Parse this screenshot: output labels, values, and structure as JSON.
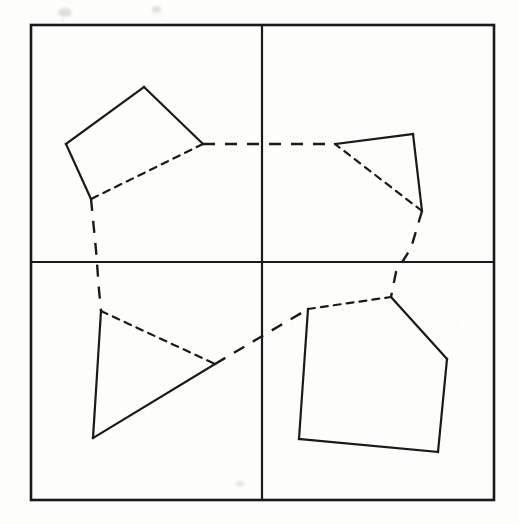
{
  "figure": {
    "canvas": {
      "width": 519,
      "height": 524
    },
    "colors": {
      "background": "#fdfdfc",
      "ink": "#1a1a1a",
      "ink_soft": "#2b2b2b"
    },
    "stroke": {
      "frame_width": 2.6,
      "divider_width": 2.2,
      "polygon_solid_width": 2.2,
      "polygon_dashed_width": 2.2,
      "connector_dashed_width": 2.4,
      "dash_short": "7 6",
      "dash_long": "12 10"
    },
    "frame": {
      "x1": 31,
      "y1": 25,
      "x2": 494,
      "y2": 500
    },
    "dividers": {
      "vertical_x": 262,
      "horizontal_y": 262
    },
    "quadrants": [
      {
        "name": "top-left",
        "label": "Q1"
      },
      {
        "name": "top-right",
        "label": "Q2"
      },
      {
        "name": "bottom-left",
        "label": "Q3"
      },
      {
        "name": "bottom-right",
        "label": "Q4"
      }
    ],
    "shapes": [
      {
        "name": "quadrilateral-top-left",
        "quadrant": "top-left",
        "vertex_count": 4,
        "vertices": [
          [
            144,
            87
          ],
          [
            203,
            144
          ],
          [
            91,
            199
          ],
          [
            66,
            144
          ]
        ],
        "edges": [
          {
            "from": [
              144,
              87
            ],
            "to": [
              203,
              144
            ],
            "style": "solid"
          },
          {
            "from": [
              203,
              144
            ],
            "to": [
              91,
              199
            ],
            "style": "dashed"
          },
          {
            "from": [
              91,
              199
            ],
            "to": [
              66,
              144
            ],
            "style": "solid"
          },
          {
            "from": [
              66,
              144
            ],
            "to": [
              144,
              87
            ],
            "style": "solid"
          }
        ]
      },
      {
        "name": "triangle-top-right",
        "quadrant": "top-right",
        "vertex_count": 3,
        "vertices": [
          [
            335,
            144
          ],
          [
            413,
            134
          ],
          [
            422,
            211
          ]
        ],
        "edges": [
          {
            "from": [
              335,
              144
            ],
            "to": [
              413,
              134
            ],
            "style": "solid"
          },
          {
            "from": [
              413,
              134
            ],
            "to": [
              422,
              211
            ],
            "style": "solid"
          },
          {
            "from": [
              422,
              211
            ],
            "to": [
              335,
              144
            ],
            "style": "dashed"
          }
        ]
      },
      {
        "name": "triangle-bottom-left",
        "quadrant": "bottom-left",
        "vertex_count": 3,
        "vertices": [
          [
            101,
            311
          ],
          [
            215,
            364
          ],
          [
            93,
            438
          ]
        ],
        "edges": [
          {
            "from": [
              101,
              311
            ],
            "to": [
              215,
              364
            ],
            "style": "dashed"
          },
          {
            "from": [
              215,
              364
            ],
            "to": [
              93,
              438
            ],
            "style": "solid"
          },
          {
            "from": [
              93,
              438
            ],
            "to": [
              101,
              311
            ],
            "style": "solid"
          }
        ]
      },
      {
        "name": "pentagon-bottom-right",
        "quadrant": "bottom-right",
        "vertex_count": 5,
        "vertices": [
          [
            308,
            309
          ],
          [
            391,
            297
          ],
          [
            447,
            359
          ],
          [
            438,
            452
          ],
          [
            299,
            439
          ]
        ],
        "edges": [
          {
            "from": [
              308,
              309
            ],
            "to": [
              391,
              297
            ],
            "style": "dashed"
          },
          {
            "from": [
              391,
              297
            ],
            "to": [
              447,
              359
            ],
            "style": "solid"
          },
          {
            "from": [
              447,
              359
            ],
            "to": [
              438,
              452
            ],
            "style": "solid"
          },
          {
            "from": [
              438,
              452
            ],
            "to": [
              299,
              439
            ],
            "style": "solid"
          },
          {
            "from": [
              299,
              439
            ],
            "to": [
              308,
              309
            ],
            "style": "solid"
          }
        ]
      }
    ],
    "connectors": [
      {
        "name": "connector-topleft-to-topright",
        "style": "dashed",
        "from_shape": "quadrilateral-top-left",
        "to_shape": "triangle-top-right",
        "points": [
          [
            203,
            144
          ],
          [
            335,
            144
          ]
        ]
      },
      {
        "name": "connector-topleft-to-bottomleft",
        "style": "dashed",
        "from_shape": "quadrilateral-top-left",
        "to_shape": "triangle-bottom-left",
        "points": [
          [
            91,
            199
          ],
          [
            96,
            250
          ],
          [
            99,
            290
          ],
          [
            101,
            311
          ]
        ]
      },
      {
        "name": "connector-topright-to-bottomright",
        "style": "dashed",
        "from_shape": "triangle-top-right",
        "to_shape": "pentagon-bottom-right",
        "points": [
          [
            422,
            211
          ],
          [
            411,
            248
          ],
          [
            396,
            272
          ],
          [
            391,
            297
          ]
        ]
      },
      {
        "name": "connector-bottomleft-to-bottomright",
        "style": "dashed",
        "from_shape": "triangle-bottom-left",
        "to_shape": "pentagon-bottom-right",
        "points": [
          [
            215,
            364
          ],
          [
            308,
            309
          ]
        ]
      }
    ],
    "artifacts": [
      {
        "name": "scan-smudge-top-left",
        "x": 58,
        "y": 8,
        "w": 14,
        "h": 9
      },
      {
        "name": "scan-smudge-top-mid",
        "x": 152,
        "y": 6,
        "w": 9,
        "h": 7
      },
      {
        "name": "scan-speck-bottom",
        "x": 236,
        "y": 481,
        "w": 8,
        "h": 5
      }
    ]
  }
}
